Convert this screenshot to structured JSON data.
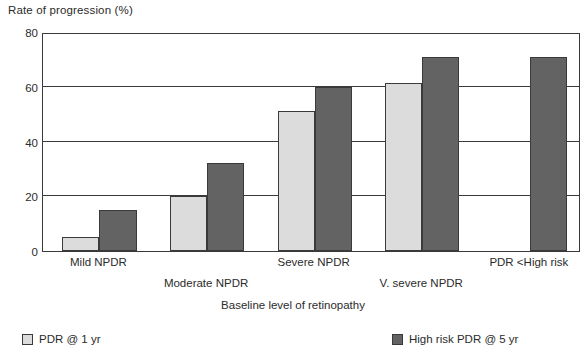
{
  "chart_data": {
    "type": "bar",
    "title": "",
    "ylabel": "Rate of progression (%)",
    "xlabel": "Baseline level of retinopathy",
    "ylim": [
      0,
      80
    ],
    "yticks": [
      0,
      20,
      40,
      60,
      80
    ],
    "grid": true,
    "legend_position": "bottom",
    "categories": [
      "Mild NPDR",
      "Moderate NPDR",
      "Severe NPDR",
      "V. severe NPDR",
      "PDR <High risk"
    ],
    "series": [
      {
        "name": "PDR @ 1 yr",
        "color": "#dcdcdc",
        "values": [
          5,
          20,
          51,
          61.5,
          null
        ]
      },
      {
        "name": "High risk PDR @ 5 yr",
        "color": "#636363",
        "values": [
          15,
          32,
          60,
          71,
          71
        ]
      }
    ]
  },
  "legend": {
    "items": [
      {
        "label": "PDR @ 1 yr",
        "swatch": "light"
      },
      {
        "label": "High risk PDR @ 5 yr",
        "swatch": "dark"
      }
    ]
  },
  "colors": {
    "light_bar": "#dcdcdc",
    "dark_bar": "#636363",
    "axis": "#3a3a3a",
    "text": "#2b2b2b",
    "background": "#ffffff"
  }
}
